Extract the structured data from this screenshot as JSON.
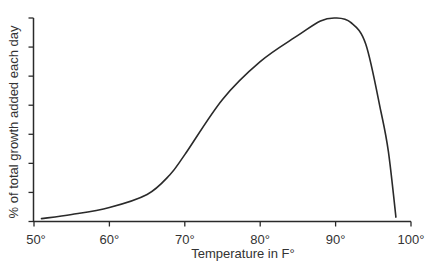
{
  "chart_data": {
    "type": "line",
    "title": "",
    "xlabel": "Temperature in F°",
    "ylabel": "% of total growth added each day",
    "xlim": [
      50,
      100
    ],
    "ylim": [
      0,
      7
    ],
    "x_ticks": [
      "50°",
      "60°",
      "70°",
      "80°",
      "90°",
      "100°"
    ],
    "x_tick_values": [
      50,
      60,
      70,
      80,
      90,
      100
    ],
    "y_tick_count": 8,
    "y_tick_labels": [],
    "grid": false,
    "legend": null,
    "series": [
      {
        "name": "growth rate",
        "x": [
          51,
          55,
          60,
          65,
          68,
          70,
          75,
          80,
          85,
          88,
          90,
          92,
          94,
          96,
          97,
          98
        ],
        "values": [
          0.1,
          0.24,
          0.48,
          0.93,
          1.6,
          2.3,
          4.2,
          5.5,
          6.4,
          6.9,
          7.0,
          6.85,
          6.1,
          3.8,
          2.4,
          0.15
        ]
      }
    ]
  },
  "colors": {
    "line": "#2a2a2a",
    "axis": "#2a2a2a",
    "text": "#333333",
    "background": "#ffffff"
  }
}
